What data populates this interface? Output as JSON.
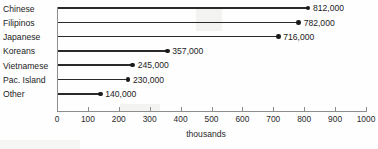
{
  "chart_data": {
    "type": "bar",
    "orientation": "horizontal",
    "title": "Number of people of Asian",
    "xlabel": "thousands",
    "ylabel": "",
    "xlim": [
      0,
      1000
    ],
    "xticks": [
      0,
      100,
      200,
      300,
      400,
      500,
      600,
      700,
      800,
      900,
      1000
    ],
    "xtick_labels": [
      "0",
      "100",
      "200",
      "300",
      "400",
      "500",
      "600",
      "700",
      "800",
      "900",
      "1000"
    ],
    "grid": false,
    "legend": false,
    "units": "thousands",
    "categories": [
      "Chinese",
      "Filipinos",
      "Japanese",
      "Koreans",
      "Vietnamese",
      "Pac. Island",
      "Other"
    ],
    "values": [
      812,
      782,
      716,
      357,
      245,
      230,
      140
    ],
    "data_labels": [
      "812,000",
      "782,000",
      "716,000",
      "357,000",
      "245,000",
      "230,000",
      "140,000"
    ],
    "marker": "circle-dot",
    "series_color": "#2a2a2a"
  },
  "axis_title_text": "thousands"
}
